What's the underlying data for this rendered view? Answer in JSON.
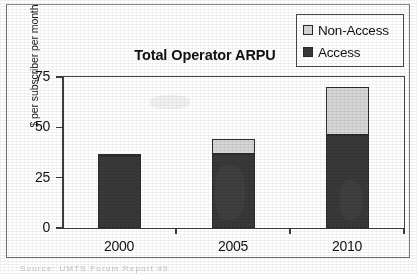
{
  "chart_data": {
    "type": "bar",
    "subtype": "stacked-column",
    "title": "Total Operator ARPU",
    "xlabel": "",
    "ylabel": "$ per subscriber per month",
    "categories": [
      "2000",
      "2005",
      "2010"
    ],
    "series": [
      {
        "name": "Access",
        "values": [
          36,
          37,
          46
        ],
        "color": "#3a3a3a"
      },
      {
        "name": "Non-Access",
        "values": [
          1,
          7,
          24
        ],
        "color": "#d5d5d5"
      }
    ],
    "totals": [
      37,
      44,
      70
    ],
    "ylim": [
      0,
      75
    ],
    "yticks": [
      0,
      25,
      50,
      75
    ],
    "ytick_labels": [
      "0",
      "25",
      "50",
      "75"
    ],
    "grid": false,
    "legend_position": "top-right",
    "legend_entries": [
      {
        "label": "Non-Access",
        "color": "#d5d5d5"
      },
      {
        "label": "Access",
        "color": "#3a3a3a"
      }
    ]
  },
  "figure": {
    "source_note": "Source: UMTS Forum Report #9"
  }
}
